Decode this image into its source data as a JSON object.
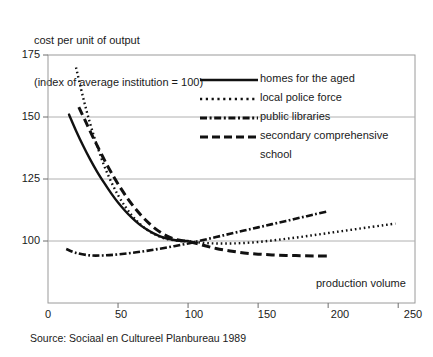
{
  "chart_data": {
    "type": "line",
    "title": "",
    "ylabel": "cost per unit of output\n(index of average institution = 100)",
    "ylabel_line1": "cost per unit of output",
    "ylabel_line2": "(index of average institution = 100)",
    "xlabel": "production volume",
    "xlim": [
      0,
      262
    ],
    "ylim": [
      88,
      175
    ],
    "xticks": [
      0,
      50,
      100,
      150,
      200,
      250
    ],
    "xtick_labels": [
      "0",
      "50",
      "100",
      "150",
      "200",
      "250"
    ],
    "yticks": [
      100,
      125,
      150,
      175
    ],
    "ytick_labels": [
      "100",
      "125",
      "150",
      "175"
    ],
    "grid": "horizontal",
    "legend_position": "upper-right-inside",
    "series": [
      {
        "name": "homes for the aged",
        "style": "solid",
        "color": "#111111",
        "x": [
          15,
          20,
          25,
          30,
          35,
          40,
          45,
          50,
          55,
          60,
          65,
          70,
          75,
          80,
          85,
          90,
          95,
          100
        ],
        "y": [
          151.0,
          144.5,
          138.5,
          133.0,
          128.0,
          123.5,
          119.3,
          115.5,
          112.2,
          109.3,
          106.8,
          104.8,
          103.2,
          101.9,
          101.0,
          100.4,
          100.1,
          100.0
        ]
      },
      {
        "name": "local police force",
        "style": "dotted",
        "color": "#111111",
        "x": [
          20,
          25,
          30,
          35,
          40,
          45,
          50,
          55,
          60,
          65,
          70,
          75,
          80,
          85,
          90,
          95,
          100,
          110,
          120,
          130,
          140,
          150,
          160,
          170,
          180,
          190,
          200,
          210,
          220,
          230,
          240,
          248
        ],
        "y": [
          170.0,
          158.0,
          147.5,
          138.5,
          130.5,
          124.0,
          118.5,
          114.0,
          110.2,
          107.2,
          104.8,
          103.0,
          101.7,
          100.8,
          100.3,
          100.0,
          99.9,
          99.3,
          99.0,
          99.0,
          99.2,
          99.6,
          100.2,
          100.9,
          101.6,
          102.4,
          103.2,
          104.0,
          104.8,
          105.6,
          106.4,
          107.0
        ]
      },
      {
        "name": "public libraries",
        "style": "dashdot",
        "color": "#111111",
        "x": [
          13,
          20,
          30,
          40,
          50,
          60,
          70,
          80,
          90,
          100,
          110,
          120,
          130,
          140,
          150,
          160,
          170,
          180,
          190,
          200
        ],
        "y": [
          96.8,
          95.2,
          94.2,
          94.2,
          94.6,
          95.2,
          96.0,
          96.9,
          97.9,
          99.0,
          100.3,
          101.6,
          102.9,
          104.2,
          105.5,
          106.8,
          108.1,
          109.4,
          110.7,
          112.0
        ]
      },
      {
        "name": "secondary comprehensive school",
        "style": "dashed",
        "color": "#111111",
        "x": [
          22,
          27,
          32,
          37,
          42,
          47,
          52,
          57,
          62,
          67,
          72,
          77,
          82,
          87,
          92,
          97,
          100,
          110,
          120,
          130,
          140,
          150,
          160,
          170,
          180,
          190,
          200
        ],
        "y": [
          154.0,
          148.0,
          142.0,
          136.3,
          130.8,
          125.8,
          121.2,
          117.0,
          113.3,
          110.0,
          107.2,
          104.8,
          102.9,
          101.5,
          100.5,
          100.0,
          99.9,
          98.4,
          97.0,
          96.0,
          95.2,
          94.7,
          94.4,
          94.2,
          94.1,
          94.0,
          94.0
        ]
      }
    ],
    "legend": [
      {
        "label": "homes for the aged",
        "style": "solid"
      },
      {
        "label": "local police force",
        "style": "dotted"
      },
      {
        "label": "public libraries",
        "style": "dashdot"
      },
      {
        "label": "secondary comprehensive",
        "label2": "school",
        "style": "dashed"
      }
    ]
  },
  "source": "Source: Sociaal en Cultureel Planbureau 1989",
  "origin_label": "0"
}
